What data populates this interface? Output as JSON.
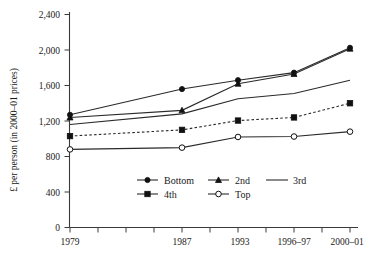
{
  "chart_data": {
    "type": "line",
    "title": "",
    "xlabel": "",
    "ylabel": "£ per person (in 2000–01 prices)",
    "categories": [
      "1979",
      "1987",
      "1993",
      "1996–97",
      "2000–01"
    ],
    "x_tick_labels": [
      "1979",
      "1987",
      "1993",
      "1996–97",
      "2000–01"
    ],
    "y_tick_labels": [
      "0",
      "400",
      "800",
      "1,200",
      "1,600",
      "2,000",
      "2,400"
    ],
    "y_tick_values": [
      0,
      400,
      800,
      1200,
      1600,
      2000,
      2400
    ],
    "ylim": [
      0,
      2400
    ],
    "grid": false,
    "legend_position": "inside-lower-center",
    "series": [
      {
        "name": "Bottom",
        "marker": "filled-diamond",
        "linestyle": "solid",
        "values": [
          1270,
          1560,
          1660,
          1745,
          2025
        ]
      },
      {
        "name": "2nd",
        "marker": "filled-triangle",
        "linestyle": "solid",
        "values": [
          1240,
          1320,
          1620,
          1730,
          2015
        ]
      },
      {
        "name": "3rd",
        "marker": "none",
        "linestyle": "solid",
        "values": [
          1160,
          1280,
          1450,
          1510,
          1660
        ]
      },
      {
        "name": "4th",
        "marker": "filled-square",
        "linestyle": "dashed",
        "values": [
          1030,
          1100,
          1205,
          1240,
          1400
        ]
      },
      {
        "name": "Top",
        "marker": "open-circle",
        "linestyle": "solid",
        "values": [
          880,
          900,
          1020,
          1025,
          1080
        ]
      }
    ]
  },
  "axes": {
    "y_title": "£ per person (in 2000–01 prices)",
    "y_labels": {
      "t0": "0",
      "t400": "400",
      "t800": "800",
      "t1200": "1,200",
      "t1600": "1,600",
      "t2000": "2,000",
      "t2400": "2,400"
    },
    "x_labels": {
      "x1": "1979",
      "x2": "1987",
      "x3": "1993",
      "x4": "1996–97",
      "x5": "2000–01"
    }
  },
  "legend": {
    "items": [
      {
        "label": "Bottom",
        "marker": "filled-diamond"
      },
      {
        "label": "2nd",
        "marker": "filled-triangle"
      },
      {
        "label": "3rd",
        "marker": "none"
      },
      {
        "label": "4th",
        "marker": "filled-square"
      },
      {
        "label": "Top",
        "marker": "open-circle"
      }
    ]
  },
  "colors": {
    "line": "#2a2a2a",
    "axis": "#3a3a3a",
    "text": "#1a1a1a",
    "background": "#ffffff"
  }
}
